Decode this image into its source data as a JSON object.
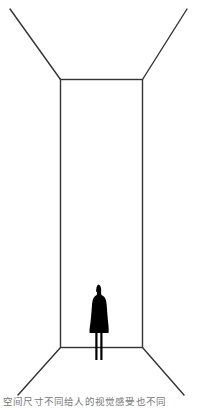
{
  "figure": {
    "line_color": "#333333",
    "figure_color": "#000000",
    "background": "#ffffff",
    "room": {
      "back_wall": {
        "x1": 60.5,
        "y1": 79.5,
        "x2": 142.5,
        "y2": 347.5
      },
      "perspective_lines": [
        {
          "name": "top-left",
          "from": [
            10,
            9
          ],
          "to": [
            60.5,
            79.5
          ]
        },
        {
          "name": "top-right",
          "from": [
            187,
            9
          ],
          "to": [
            142.5,
            79.5
          ]
        },
        {
          "name": "bottom-left",
          "from": [
            60.5,
            347.5
          ],
          "to": [
            18,
            395
          ]
        },
        {
          "name": "bottom-right",
          "from": [
            142.5,
            347.5
          ],
          "to": [
            184,
            395
          ]
        }
      ]
    },
    "person": {
      "x": 99,
      "head_top": 284,
      "feet": 360
    }
  },
  "caption": {
    "text": "空间尺寸不同给人的视觉感受也不同"
  }
}
